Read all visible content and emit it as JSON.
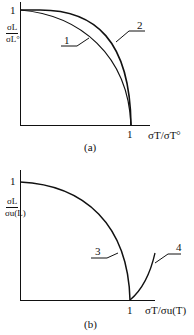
{
  "diagram_a": {
    "caption": "(a)",
    "y_tick": "1",
    "x_tick": "1",
    "y_label_num": "σL",
    "y_label_den": "σL°",
    "x_label": "σT/σT°",
    "curves": [
      {
        "id": "1",
        "label": "1",
        "description": "inner curve"
      },
      {
        "id": "2",
        "label": "2",
        "description": "outer curve"
      }
    ]
  },
  "diagram_b": {
    "caption": "(b)",
    "y_tick": "1",
    "x_tick": "1",
    "y_label_num": "σL",
    "y_label_den": "σu(L)",
    "x_label": "σT/σu(T)",
    "curves": [
      {
        "id": "3",
        "label": "3",
        "description": "failure envelope from y=1 to x=1"
      },
      {
        "id": "4",
        "label": "4",
        "description": "rising branch beyond x=1"
      }
    ]
  }
}
